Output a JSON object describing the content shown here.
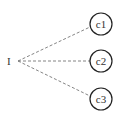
{
  "diagram": {
    "root": {
      "label": "I",
      "x": 10,
      "y": 61
    },
    "edge_style": "dashed",
    "children": [
      {
        "label": "c1",
        "cx": 101,
        "cy": 24,
        "r": 11
      },
      {
        "label": "c2",
        "cx": 101,
        "cy": 61,
        "r": 11
      },
      {
        "label": "c3",
        "cx": 101,
        "cy": 99,
        "r": 11
      }
    ],
    "colors": {
      "node_stroke": "#222222",
      "edge": "#777777",
      "text": "#333333"
    }
  }
}
